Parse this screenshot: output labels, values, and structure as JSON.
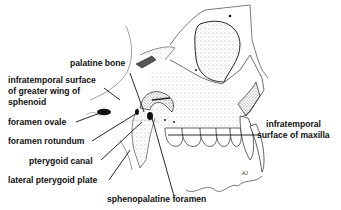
{
  "diagram": {
    "labels": [
      {
        "id": "palatine-bone",
        "text": "palatine bone"
      },
      {
        "id": "infratemporal-sphenoid-1",
        "text": "infratemporal surface"
      },
      {
        "id": "infratemporal-sphenoid-2",
        "text": "of greater wing of"
      },
      {
        "id": "infratemporal-sphenoid-3",
        "text": "sphenoid"
      },
      {
        "id": "foramen-ovale",
        "text": "foramen ovale"
      },
      {
        "id": "foramen-rotundum",
        "text": "foramen rotundum"
      },
      {
        "id": "pterygoid-canal",
        "text": "pterygoid canal"
      },
      {
        "id": "lateral-pterygoid-plate",
        "text": "lateral pterygoid plate"
      },
      {
        "id": "sphenopalatine-foramen",
        "text": "sphenopalatine foramen"
      },
      {
        "id": "infratemporal-maxilla-1",
        "text": "infratemporal"
      },
      {
        "id": "infratemporal-maxilla-2",
        "text": "surface of maxilla"
      }
    ],
    "signature": "AJ"
  }
}
